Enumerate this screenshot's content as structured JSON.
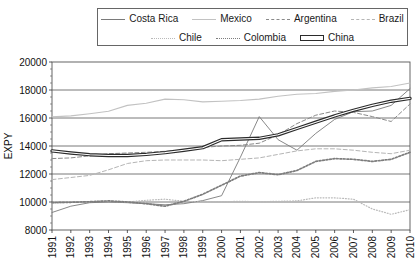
{
  "axis": {
    "ylabel": "EXPY",
    "y_ticks": [
      "20000",
      "18000",
      "16000",
      "14000",
      "12000",
      "10000",
      "8000"
    ],
    "x_ticks": [
      "1991",
      "1992",
      "1993",
      "1994",
      "1995",
      "1996",
      "1997",
      "1998",
      "1999",
      "2000",
      "2001",
      "2002",
      "2003",
      "2004",
      "2005",
      "2006",
      "2007",
      "2008",
      "2009",
      "2010"
    ]
  },
  "legend": {
    "row1": [
      {
        "label": "Costa Rica",
        "key": "k-solid-gray"
      },
      {
        "label": "Mexico",
        "key": "k-solid-light"
      },
      {
        "label": "Argentina",
        "key": "k-dash-gray"
      },
      {
        "label": "Brazil",
        "key": "k-dash-light"
      }
    ],
    "row2": [
      {
        "label": "Chile",
        "key": "k-dot-fine"
      },
      {
        "label": "Colombia",
        "key": "k-dot-coarse"
      },
      {
        "label": "China",
        "key": "k-china"
      }
    ]
  },
  "chart_data": {
    "type": "line",
    "title": "",
    "xlabel": "",
    "ylabel": "EXPY",
    "x": [
      1991,
      1992,
      1993,
      1994,
      1995,
      1996,
      1997,
      1998,
      1999,
      2000,
      2001,
      2002,
      2003,
      2004,
      2005,
      2006,
      2007,
      2008,
      2009,
      2010
    ],
    "xlim": [
      1991,
      2010
    ],
    "ylim": [
      8000,
      20000
    ],
    "grid": true,
    "legend_position": "top",
    "series": [
      {
        "name": "Costa Rica",
        "style": "solid",
        "color": "#7a7a7a",
        "width": 0.9,
        "values": [
          9250,
          9700,
          9950,
          10000,
          9950,
          9880,
          9800,
          9880,
          10100,
          10450,
          13200,
          16100,
          14450,
          13700,
          14900,
          15900,
          16450,
          16500,
          16900,
          18100
        ]
      },
      {
        "name": "Mexico",
        "style": "solid",
        "color": "#c2c2c2",
        "width": 1.1,
        "values": [
          16080,
          16150,
          16300,
          16480,
          16900,
          17050,
          17350,
          17300,
          17150,
          17200,
          17250,
          17350,
          17550,
          17700,
          17750,
          17900,
          18000,
          18150,
          18250,
          18500
        ]
      },
      {
        "name": "Argentina",
        "style": "dashed",
        "color": "#8a8a8a",
        "width": 1.0,
        "values": [
          13100,
          13150,
          13300,
          13450,
          13500,
          13550,
          13620,
          13700,
          13900,
          14000,
          14050,
          14200,
          14800,
          15600,
          16200,
          16500,
          16400,
          16100,
          15750,
          17000
        ]
      },
      {
        "name": "Brazil",
        "style": "dashed",
        "color": "#b5b5b5",
        "width": 1.0,
        "values": [
          11600,
          11750,
          11900,
          12300,
          12750,
          12950,
          13000,
          13000,
          13000,
          12950,
          13050,
          13150,
          13400,
          13650,
          13800,
          13800,
          13700,
          13550,
          13450,
          13700
        ]
      },
      {
        "name": "Chile",
        "style": "dotted-fine",
        "color": "#b9b9b9",
        "width": 1.2,
        "values": [
          9920,
          9980,
          10030,
          10050,
          10000,
          10120,
          10200,
          10050,
          10000,
          10020,
          10050,
          10020,
          10050,
          10080,
          10300,
          10300,
          10200,
          9500,
          9120,
          9450
        ]
      },
      {
        "name": "Colombia",
        "style": "dotted-coarse",
        "color": "#7d7d7d",
        "width": 1.7,
        "values": [
          9960,
          9980,
          10020,
          10080,
          10000,
          9880,
          9700,
          10050,
          10550,
          11200,
          11850,
          12100,
          11950,
          12250,
          12900,
          13100,
          13050,
          12900,
          13050,
          13550
        ]
      },
      {
        "name": "China",
        "style": "thick-outline",
        "color": "#2b2b2b",
        "width": 2.6,
        "values": [
          13650,
          13500,
          13380,
          13320,
          13320,
          13400,
          13530,
          13700,
          13880,
          14450,
          14500,
          14550,
          14800,
          15250,
          15700,
          16150,
          16550,
          16900,
          17200,
          17400
        ]
      }
    ]
  }
}
